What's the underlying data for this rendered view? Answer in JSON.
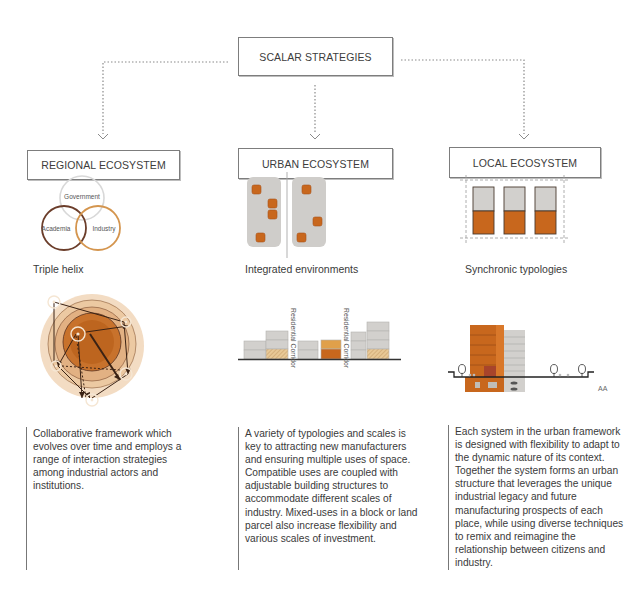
{
  "diagram": {
    "root": {
      "label": "SCALAR STRATEGIES"
    },
    "columns": [
      {
        "id": "regional",
        "heading": "REGIONAL ECOSYSTEM",
        "caption": "Triple helix",
        "venn_labels": [
          "Government",
          "Academia",
          "Industry"
        ],
        "description": "Collaborative framework which evolves over time and employs a range of interaction strategies among industrial actors and institutions."
      },
      {
        "id": "urban",
        "heading": "URBAN ECOSYSTEM",
        "caption": "Integrated environments",
        "section_labels": [
          "Residential Corridor",
          "Residential Corridor"
        ],
        "description": "A variety of typologies and scales is key to attracting new manufacturers and ensuring multiple uses of space. Compatible uses are coupled with adjustable building structures to accommodate different scales of industry. Mixed-uses in a block or land parcel also increase flexibility and various scales of investment."
      },
      {
        "id": "local",
        "heading": "LOCAL ECOSYSTEM",
        "caption": "Synchronic typologies",
        "section_label": "AA",
        "description": "Each system in the urban framework is designed with flexibility to adapt to the dynamic nature of its context. Together the system forms an urban structure that leverages the unique industrial legacy and future manufacturing prospects of each place, while using diverse techniques to remix and reimagine the relationship between citizens and industry."
      }
    ]
  },
  "colors": {
    "orange": "#c8671d",
    "light_orange": "#e0a04a",
    "dark_brown": "#5a3322",
    "tan": "#d9a86b",
    "grey_block": "#d2d0cd",
    "ring_pale": "#f3dcc3",
    "ring_mid": "#e8bf94",
    "ring_deep": "#d6924f",
    "core": "#b9611d"
  }
}
